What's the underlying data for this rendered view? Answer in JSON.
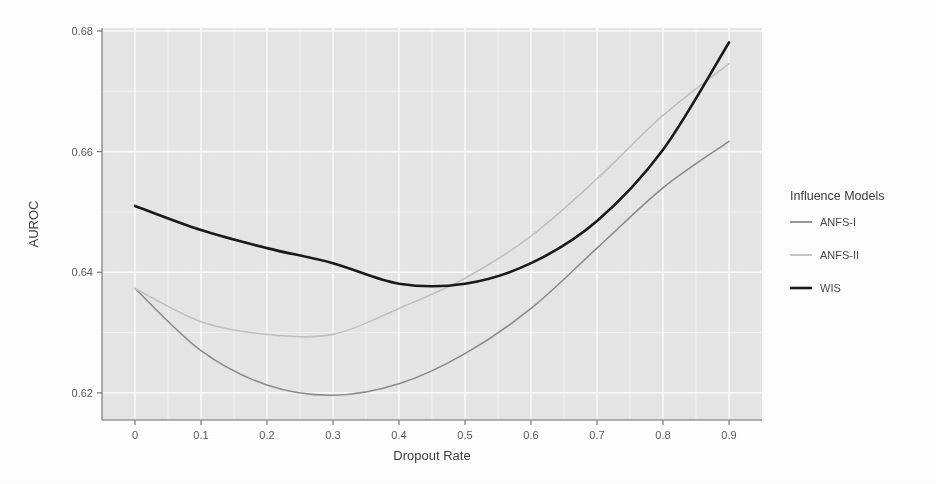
{
  "figure": {
    "background_color": "#ffffff",
    "panel_color": "#e7e7e7",
    "grid_color": "#fbfbfb"
  },
  "axes": {
    "x_title": "Dropout Rate",
    "y_title": "AUROC",
    "x_ticks": [
      "0",
      "0.1",
      "0.2",
      "0.3",
      "0.4",
      "0.5",
      "0.6",
      "0.7",
      "0.8",
      "0.9"
    ],
    "y_ticks": [
      "0.62",
      "0.64",
      "0.66",
      "0.68"
    ]
  },
  "legend": {
    "title": "Influence Models",
    "items": [
      {
        "label": "ANFS-I",
        "color": "#8c8c8c"
      },
      {
        "label": "ANFS-II",
        "color": "#c2c2c2"
      },
      {
        "label": "WIS",
        "color": "#1a1a1a"
      }
    ]
  },
  "chart_data": {
    "type": "line",
    "title": "",
    "subtitle": "",
    "xlabel": "Dropout Rate",
    "ylabel": "AUROC",
    "x": [
      0,
      0.1,
      0.2,
      0.3,
      0.4,
      0.5,
      0.6,
      0.7,
      0.8,
      0.9
    ],
    "xlim": [
      -0.05,
      0.95
    ],
    "ylim": [
      0.6155,
      0.6805
    ],
    "x_ticks": [
      0,
      0.1,
      0.2,
      0.3,
      0.4,
      0.5,
      0.6,
      0.7,
      0.8,
      0.9
    ],
    "y_ticks": [
      0.62,
      0.64,
      0.66,
      0.68
    ],
    "grid": true,
    "legend_position": "right",
    "legend_title": "Influence Models",
    "series": [
      {
        "name": "ANFS-I",
        "color": "#8c8c8c",
        "linewidth": 1.6,
        "values": [
          0.6373,
          0.627,
          0.6213,
          0.6196,
          0.6215,
          0.6265,
          0.634,
          0.644,
          0.654,
          0.6617
        ]
      },
      {
        "name": "ANFS-II",
        "color": "#c2c2c2",
        "linewidth": 1.6,
        "values": [
          0.6373,
          0.6318,
          0.6297,
          0.6297,
          0.634,
          0.639,
          0.646,
          0.6555,
          0.666,
          0.6746
        ]
      },
      {
        "name": "WIS",
        "color": "#1a1a1a",
        "linewidth": 2.6,
        "values": [
          0.651,
          0.647,
          0.644,
          0.6415,
          0.6381,
          0.6381,
          0.6415,
          0.6485,
          0.6603,
          0.6781
        ]
      }
    ]
  }
}
